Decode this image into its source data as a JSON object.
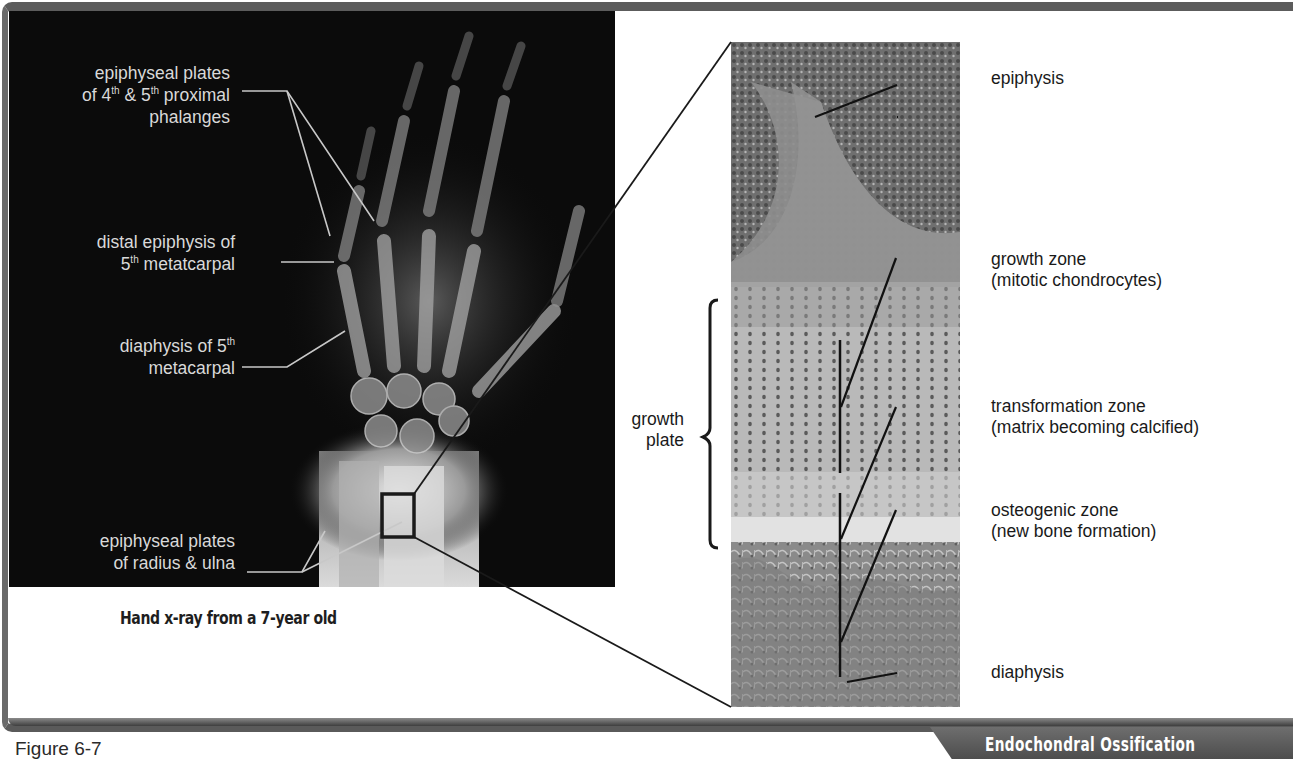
{
  "figure": {
    "number_label": "Figure 6-7",
    "title_badge": "Endochondral Ossification",
    "colors": {
      "frame": "#5c5c5c",
      "xray_background": "#0b0b0b",
      "xray_label_text": "#d9d9d9",
      "badge_background": "#5a5a5a",
      "badge_text": "#ffffff"
    }
  },
  "xray_panel": {
    "caption": "Hand x-ray from a 7-year old",
    "labels": [
      {
        "id": "phalanges",
        "line1": "epiphyseal plates",
        "line2_pre": "of 4",
        "sup1": "th",
        "line2_mid": " & 5",
        "sup2": "th",
        "line2_post": " proximal",
        "line3": "phalanges"
      },
      {
        "id": "distal-epiphysis",
        "line1": "distal epiphysis of",
        "line2_pre": "5",
        "sup1": "th",
        "line2_post": " metatcarpal"
      },
      {
        "id": "diaphysis-metacarpal",
        "line1_pre": "diaphysis of 5",
        "sup1": "th",
        "line2": "metacarpal"
      },
      {
        "id": "radius-ulna",
        "line1": "epiphyseal plates",
        "line2": "of radius & ulna"
      }
    ]
  },
  "histology_panel": {
    "bracket_label": {
      "line1": "growth",
      "line2": "plate"
    },
    "labels": [
      {
        "id": "epiphysis",
        "line1": "epiphysis"
      },
      {
        "id": "growth-zone",
        "line1": "growth zone",
        "line2": "(mitotic chondrocytes)"
      },
      {
        "id": "transformation-zone",
        "line1": "transformation zone",
        "line2": "(matrix becoming calcified)"
      },
      {
        "id": "osteogenic-zone",
        "line1": "osteogenic zone",
        "line2": "(new bone formation)"
      },
      {
        "id": "diaphysis",
        "line1": "diaphysis"
      }
    ]
  }
}
